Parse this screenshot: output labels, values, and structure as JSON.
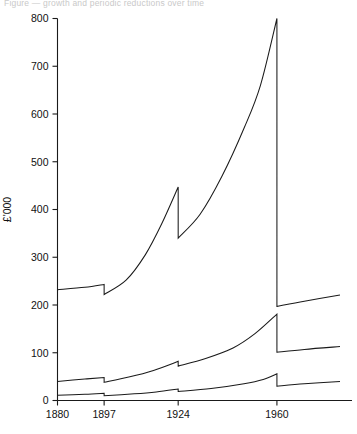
{
  "caption": "Figure — growth and periodic reductions over time",
  "chart_data": {
    "type": "line",
    "title": "",
    "xlabel": "",
    "ylabel": "£'000",
    "xlim": [
      1880,
      1983
    ],
    "ylim": [
      0,
      800
    ],
    "ytick_labels": [
      "0",
      "100",
      "200",
      "300",
      "400",
      "500",
      "600",
      "700",
      "800"
    ],
    "yticks": [
      0,
      100,
      200,
      300,
      400,
      500,
      600,
      700,
      800
    ],
    "xtick_labels": [
      "1880",
      "1897",
      "1924",
      "1960"
    ],
    "xticks": [
      1880,
      1897,
      1924,
      1960
    ],
    "grid": false,
    "legend": "none",
    "breakpoints": [
      1897,
      1924,
      1960
    ],
    "series": [
      {
        "name": "upper",
        "points": [
          {
            "x": 1880,
            "y": 232
          },
          {
            "x": 1890,
            "y": 237
          },
          {
            "x": 1897,
            "y": 243
          },
          {
            "x": 1897,
            "y": 222
          },
          {
            "x": 1905,
            "y": 252
          },
          {
            "x": 1912,
            "y": 305
          },
          {
            "x": 1918,
            "y": 370
          },
          {
            "x": 1924,
            "y": 447
          },
          {
            "x": 1924,
            "y": 340
          },
          {
            "x": 1932,
            "y": 390
          },
          {
            "x": 1940,
            "y": 470
          },
          {
            "x": 1948,
            "y": 570
          },
          {
            "x": 1954,
            "y": 660
          },
          {
            "x": 1960,
            "y": 800
          },
          {
            "x": 1960,
            "y": 197
          },
          {
            "x": 1970,
            "y": 208
          },
          {
            "x": 1983,
            "y": 221
          }
        ]
      },
      {
        "name": "middle",
        "points": [
          {
            "x": 1880,
            "y": 40
          },
          {
            "x": 1890,
            "y": 45
          },
          {
            "x": 1897,
            "y": 48
          },
          {
            "x": 1897,
            "y": 38
          },
          {
            "x": 1906,
            "y": 49
          },
          {
            "x": 1915,
            "y": 63
          },
          {
            "x": 1924,
            "y": 82
          },
          {
            "x": 1924,
            "y": 72
          },
          {
            "x": 1934,
            "y": 88
          },
          {
            "x": 1944,
            "y": 110
          },
          {
            "x": 1952,
            "y": 140
          },
          {
            "x": 1960,
            "y": 181
          },
          {
            "x": 1960,
            "y": 101
          },
          {
            "x": 1970,
            "y": 107
          },
          {
            "x": 1983,
            "y": 113
          }
        ]
      },
      {
        "name": "lower",
        "points": [
          {
            "x": 1880,
            "y": 11
          },
          {
            "x": 1890,
            "y": 13
          },
          {
            "x": 1897,
            "y": 15
          },
          {
            "x": 1897,
            "y": 10
          },
          {
            "x": 1908,
            "y": 14
          },
          {
            "x": 1916,
            "y": 18
          },
          {
            "x": 1924,
            "y": 24
          },
          {
            "x": 1924,
            "y": 19
          },
          {
            "x": 1936,
            "y": 25
          },
          {
            "x": 1948,
            "y": 35
          },
          {
            "x": 1955,
            "y": 44
          },
          {
            "x": 1960,
            "y": 56
          },
          {
            "x": 1960,
            "y": 30
          },
          {
            "x": 1970,
            "y": 35
          },
          {
            "x": 1983,
            "y": 40
          }
        ]
      }
    ]
  }
}
